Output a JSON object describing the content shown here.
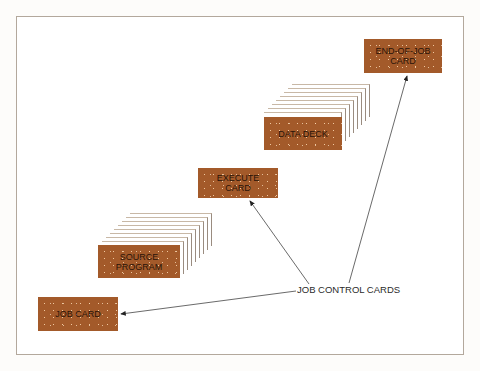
{
  "figure": {
    "cards": [
      {
        "id": "end-of-job",
        "label_line1": "END-OF-JOB",
        "label_line2": "CARD"
      },
      {
        "id": "data-deck",
        "label_line1": "DATA DECK",
        "label_line2": ""
      },
      {
        "id": "execute",
        "label_line1": "EXECUTE",
        "label_line2": "CARD"
      },
      {
        "id": "source-program",
        "label_line1": "SOURCE",
        "label_line2": "PROGRAM"
      },
      {
        "id": "job-card",
        "label_line1": "JOB CARD",
        "label_line2": ""
      }
    ],
    "callout_label": "JOB CONTROL CARDS",
    "colors": {
      "card": "#a35a2a",
      "frame": "#b3a89c",
      "text": "#2a1408"
    }
  }
}
